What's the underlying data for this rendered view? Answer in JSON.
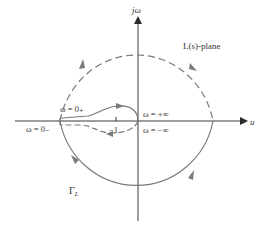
{
  "diagram": {
    "title": "",
    "colors": {
      "axis": "#3a3a3a",
      "contour": "#7a7a7a",
      "text": "#333333",
      "background": "#ffffff"
    },
    "axes": {
      "vertical_label": "jω",
      "horizontal_label": "u"
    },
    "labels": {
      "plane": "L(s)-plane",
      "omega_0_plus": "ω = 0₊",
      "omega_0_minus": "ω = 0₋",
      "omega_plus_inf": "ω = +∞",
      "omega_minus_inf": "ω = −∞",
      "minus_one": "−1",
      "contour_name": "Γ",
      "contour_subscript": "L"
    },
    "legend": {
      "dashed": "upper semicircle / negative-frequency branch",
      "solid": "lower semicircle / positive-frequency branch"
    }
  }
}
